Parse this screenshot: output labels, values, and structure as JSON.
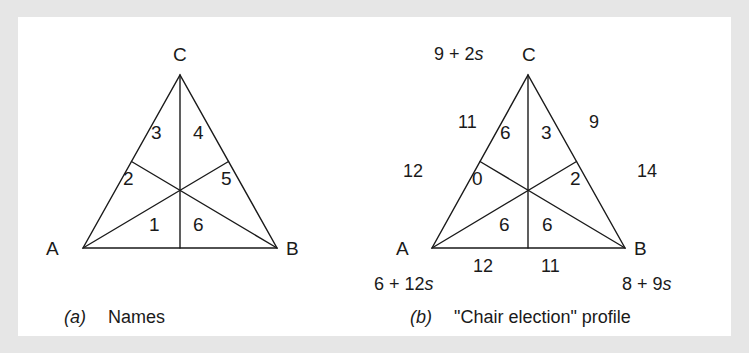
{
  "figure": {
    "background_color": "#e6e6e6",
    "panel_color": "#ffffff",
    "line_color": "#1a1a1a"
  },
  "panel_a": {
    "caption_tag": "(a)",
    "caption_text": "Names",
    "vertices": {
      "a": "A",
      "b": "B",
      "c": "C"
    },
    "regions": {
      "bottom_left": "1",
      "upper_left": "2",
      "top_left": "3",
      "top_right": "4",
      "upper_right": "5",
      "bottom_right": "6"
    }
  },
  "panel_b": {
    "caption_tag": "(b)",
    "caption_text": "\"Chair election\" profile",
    "vertices": {
      "a": "A",
      "b": "B",
      "c": "C"
    },
    "regions": {
      "bottom_left": "6",
      "upper_left": "0",
      "top_left": "6",
      "top_right": "3",
      "upper_right": "2",
      "bottom_right": "6"
    },
    "edge_labels": {
      "left_upper": "11",
      "left_lower": "12",
      "right_upper": "9",
      "right_lower": "14",
      "bottom_left": "12",
      "bottom_right": "11"
    },
    "corner_expressions": {
      "c_top": "9 + 2s",
      "a_bottom_left": "6 + 12s",
      "b_bottom_right": "8 + 9s"
    }
  },
  "chart_data": {
    "type": "diagram",
    "panels": [
      {
        "label": "(a)",
        "caption": "Names",
        "vertices": [
          "A",
          "B",
          "C"
        ],
        "region_names": [
          "1",
          "2",
          "3",
          "4",
          "5",
          "6"
        ],
        "region_order": [
          "bottom_left",
          "upper_left",
          "top_left",
          "top_right",
          "upper_right",
          "bottom_right"
        ]
      },
      {
        "label": "(b)",
        "caption": "\"Chair election\" profile",
        "vertices": [
          "A",
          "B",
          "C"
        ],
        "region_values": [
          6,
          0,
          6,
          3,
          2,
          6
        ],
        "region_order": [
          "bottom_left",
          "upper_left",
          "top_left",
          "top_right",
          "upper_right",
          "bottom_right"
        ],
        "edge_values": {
          "left_upper": 11,
          "left_lower": 12,
          "right_upper": 9,
          "right_lower": 14,
          "bottom_left": 12,
          "bottom_right": 11
        },
        "corner_totals": {
          "C": "9 + 2s",
          "A": "6 + 12s",
          "B": "8 + 9s"
        }
      }
    ]
  }
}
